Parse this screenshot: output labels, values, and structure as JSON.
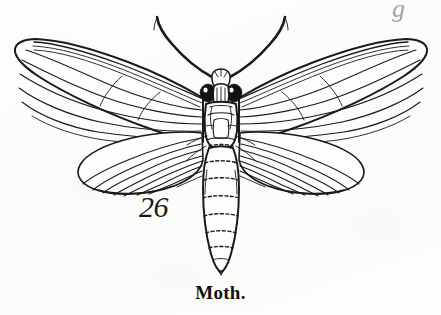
{
  "figure": {
    "number_label": "26",
    "caption": "Moth.",
    "corner_mark": "g",
    "subject": "moth",
    "style": "engraving",
    "ink_color": "#1a1a1a",
    "paper_color": "#fdfdfc"
  },
  "anatomy": {
    "antennae": {
      "name": "antennae",
      "count": 2
    },
    "head": {
      "name": "head",
      "eyes": 2,
      "eye_color": "#111111"
    },
    "thorax": {
      "name": "thorax"
    },
    "abdomen": {
      "name": "abdomen",
      "segments": 7
    },
    "forewings": {
      "name": "forewings",
      "count": 2,
      "veins_per_wing": 8
    },
    "hindwings": {
      "name": "hindwings",
      "count": 2,
      "veins_per_wing": 9
    }
  }
}
